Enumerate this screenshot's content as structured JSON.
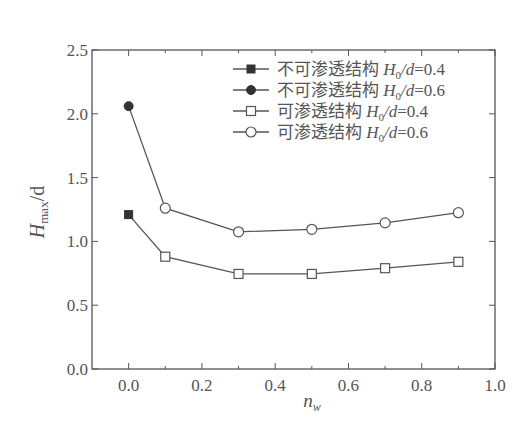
{
  "chart_data": {
    "type": "line",
    "title": "",
    "xlabel": "n_w",
    "ylabel": "H_max/d",
    "xlim": [
      -0.1,
      1.0
    ],
    "ylim": [
      0.0,
      2.5
    ],
    "x_ticks": [
      "0.0",
      "0.2",
      "0.4",
      "0.6",
      "0.8",
      "1.0"
    ],
    "y_ticks": [
      "0.0",
      "0.5",
      "1.0",
      "1.5",
      "2.0",
      "2.5"
    ],
    "grid": false,
    "legend_position": "upper right",
    "series": [
      {
        "name": "不可渗透结构 H0/d=0.4",
        "marker": "filled-square",
        "x": [
          0.0
        ],
        "values": [
          1.21
        ]
      },
      {
        "name": "不可渗透结构 H0/d=0.6",
        "marker": "filled-circle",
        "x": [
          0.0
        ],
        "values": [
          2.06
        ]
      },
      {
        "name": "可渗透结构 H0/d=0.4",
        "marker": "open-square",
        "x": [
          0.1,
          0.3,
          0.5,
          0.7,
          0.9
        ],
        "values": [
          0.88,
          0.745,
          0.745,
          0.79,
          0.84
        ],
        "connect_from": {
          "x": 0.0,
          "y": 1.21
        }
      },
      {
        "name": "可渗透结构 H0/d=0.6",
        "marker": "open-circle",
        "x": [
          0.1,
          0.3,
          0.5,
          0.7,
          0.9
        ],
        "values": [
          1.26,
          1.075,
          1.095,
          1.145,
          1.225
        ],
        "connect_from": {
          "x": 0.0,
          "y": 2.06
        }
      }
    ]
  },
  "legend": [
    {
      "cn": "不可渗透结构",
      "var": "H",
      "sub": "0",
      "rest": "/d=0.4"
    },
    {
      "cn": "不可渗透结构",
      "var": "H",
      "sub": "0",
      "rest": "/d=0.6"
    },
    {
      "cn": "可渗透结构",
      "var": "H",
      "sub": "0",
      "rest": "/d=0.4"
    },
    {
      "cn": "可渗透结构",
      "var": "H",
      "sub": "0",
      "rest": "/d=0.6"
    }
  ],
  "axes": {
    "ylabel_main": "H",
    "ylabel_sub": "max",
    "ylabel_rest": "/d",
    "xlabel_main": "n",
    "xlabel_sub": "w"
  },
  "colors": {
    "line": "#555555",
    "text": "#555555",
    "background": "#ffffff"
  }
}
